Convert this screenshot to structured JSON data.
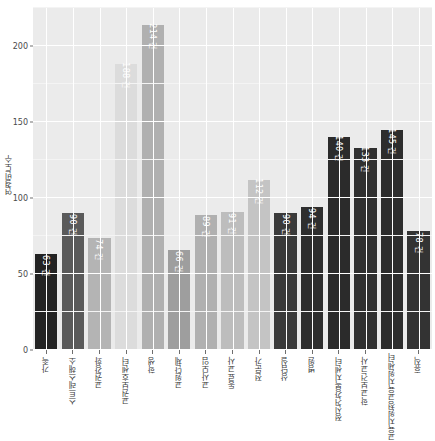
{
  "chart_data": {
    "type": "bar",
    "title": "",
    "xlabel": "",
    "ylabel": "연결빈도수",
    "ylim": [
      0,
      225
    ],
    "yticks": [
      0,
      50,
      100,
      150,
      200
    ],
    "ytick_labels": [
      "0",
      "50",
      "100",
      "150",
      "200"
    ],
    "grid": true,
    "legend": "none",
    "unit_suffix": "건",
    "categories": [
      "가족",
      "스트레스해소",
      "교권강화",
      "교권보호센터",
      "학생",
      "교원단체",
      "교사모임",
      "동료교사",
      "전문가",
      "상담실",
      "병원",
      "정신건강복지센터",
      "학교보건교사",
      "교육지원청교육지원센터",
      "휴직"
    ],
    "values": [
      63,
      90,
      74,
      188,
      214,
      66,
      89,
      91,
      112,
      90,
      94,
      140,
      133,
      145,
      78
    ],
    "value_labels": [
      "63 건",
      "90 건",
      "74 건",
      "188 건",
      "214 건",
      "66 건",
      "89 건",
      "91 건",
      "112 건",
      "90 건",
      "94 건",
      "140 건",
      "133 건",
      "145 건",
      "78 건"
    ],
    "bar_colors": [
      "#232323",
      "#5a5a5a",
      "#b4b4b4",
      "#dcdcdc",
      "#b0b0b0",
      "#9e9e9e",
      "#b0b0b0",
      "#bdbdbd",
      "#c4c4c4",
      "#3a3a3a",
      "#2e2e2e",
      "#2b2b2b",
      "#303030",
      "#2d2d2d",
      "#333333"
    ],
    "label_colors": [
      "#ffffff",
      "#ffffff",
      "#ffffff",
      "#ffffff",
      "#ffffff",
      "#ffffff",
      "#ffffff",
      "#ffffff",
      "#ffffff",
      "#ffffff",
      "#ffffff",
      "#ffffff",
      "#ffffff",
      "#ffffff",
      "#ffffff"
    ],
    "panel_background": "#ebebeb",
    "gridline_color": "#ffffff"
  }
}
